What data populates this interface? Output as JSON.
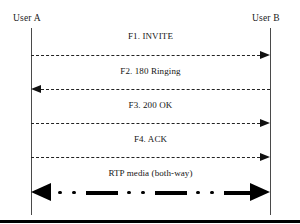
{
  "diagram": {
    "type": "sequence-diagram",
    "actors": [
      {
        "id": "user-a",
        "label": "User A",
        "x": 31
      },
      {
        "id": "user-b",
        "label": "User B",
        "x": 270
      }
    ],
    "messages": [
      {
        "id": "f1",
        "label": "F1. INVITE",
        "from": "user-a",
        "to": "user-b",
        "direction": "right",
        "style": "dashed",
        "y": 55
      },
      {
        "id": "f2",
        "label": "F2. 180 Ringing",
        "from": "user-b",
        "to": "user-a",
        "direction": "left",
        "style": "dashed",
        "y": 89
      },
      {
        "id": "f3",
        "label": "F3. 200 OK",
        "from": "user-a",
        "to": "user-b",
        "direction": "right",
        "style": "dashed",
        "y": 123
      },
      {
        "id": "f4",
        "label": "F4. ACK",
        "from": "user-a",
        "to": "user-b",
        "direction": "right",
        "style": "dashed",
        "y": 157
      },
      {
        "id": "rtp",
        "label": "RTP media (both-way)",
        "from": "user-a",
        "to": "user-b",
        "direction": "both",
        "style": "thick-dash-dot-dot",
        "y": 192
      }
    ],
    "colors": {
      "line": "#222222",
      "lifeline": "#4a4a4a",
      "text": "#141414",
      "rule": "#000000",
      "background": "#ffffff"
    }
  }
}
